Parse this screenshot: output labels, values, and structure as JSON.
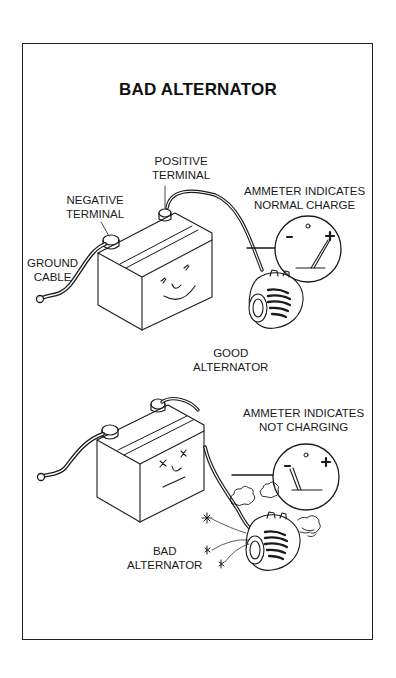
{
  "title": "BAD ALTERNATOR",
  "top_panel": {
    "positive_terminal": [
      "POSITIVE",
      "TERMINAL"
    ],
    "negative_terminal": [
      "NEGATIVE",
      "TERMINAL"
    ],
    "ground_cable": [
      "GROUND",
      "CABLE"
    ],
    "ammeter_caption": [
      "AMMETER INDICATES",
      "NORMAL CHARGE"
    ],
    "ammeter_minus": "-",
    "ammeter_plus": "+",
    "alternator_label": [
      "GOOD",
      "ALTERNATOR"
    ],
    "battery_face": "smiling"
  },
  "bottom_panel": {
    "ammeter_caption": [
      "AMMETER INDICATES",
      "NOT CHARGING"
    ],
    "ammeter_minus": "-",
    "ammeter_plus": "+",
    "alternator_label": [
      "BAD",
      "ALTERNATOR"
    ],
    "battery_face": "dazed"
  },
  "colors": {
    "ink": "#1a1a1a",
    "background": "#ffffff",
    "frame": "#222222"
  }
}
